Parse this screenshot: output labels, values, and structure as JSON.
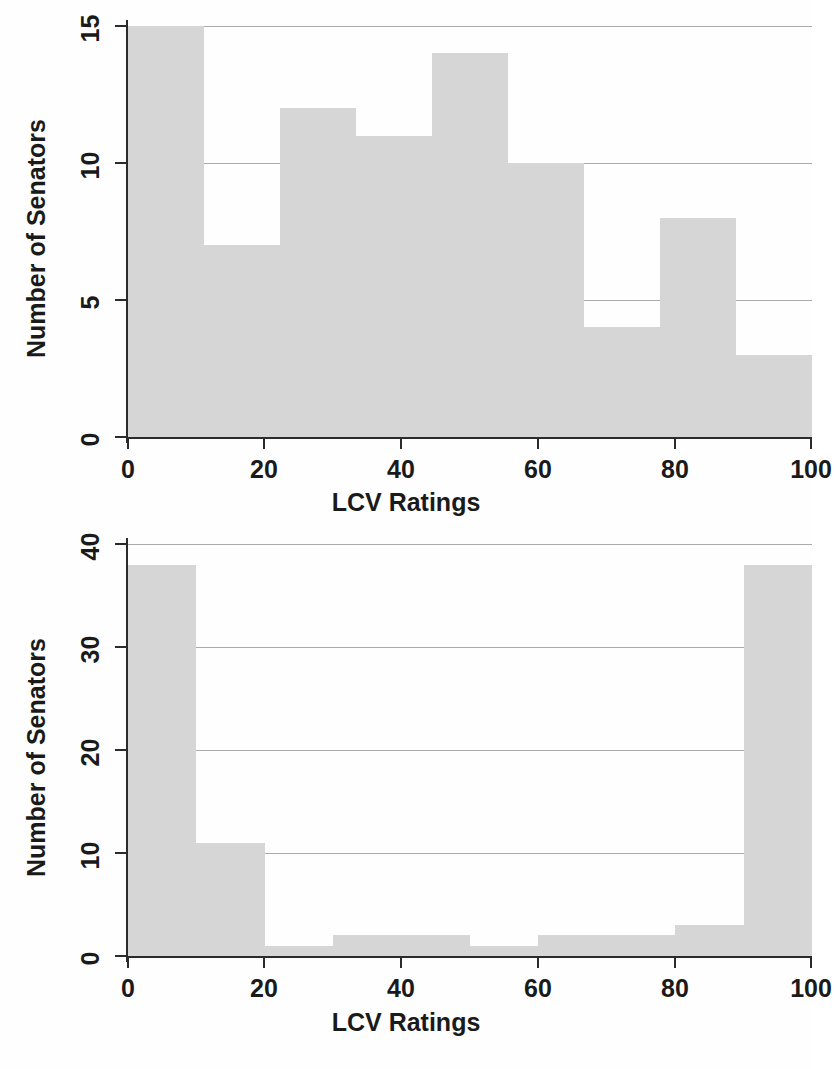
{
  "figure": {
    "background_color": "#fefefe",
    "bar_color": "#d6d6d6",
    "axis_color": "#2b2b2b",
    "grid_color": "#8e8e8e"
  },
  "charts": [
    {
      "id": "top",
      "xlabel": "LCV Ratings",
      "ylabel": "Number of Senators",
      "xticks": [
        "0",
        "20",
        "40",
        "60",
        "80",
        "100"
      ],
      "yticks": [
        "0",
        "5",
        "10",
        "15"
      ]
    },
    {
      "id": "bottom",
      "xlabel": "LCV Ratings",
      "ylabel": "Number of Senators",
      "xticks": [
        "0",
        "20",
        "40",
        "60",
        "80",
        "100"
      ],
      "yticks": [
        "0",
        "10",
        "20",
        "30",
        "40"
      ]
    }
  ],
  "chart_data": [
    {
      "type": "bar",
      "id": "top-histogram",
      "title": "",
      "xlabel": "LCV Ratings",
      "ylabel": "Number of Senators",
      "xlim": [
        0,
        100
      ],
      "ylim": [
        0,
        15
      ],
      "xticks": [
        0,
        20,
        40,
        60,
        80,
        100
      ],
      "yticks": [
        0,
        5,
        10,
        15
      ],
      "grid": true,
      "grid_axis": "y",
      "bin_edges": [
        0,
        11.1,
        22.2,
        33.3,
        44.4,
        55.6,
        66.7,
        77.8,
        88.9,
        100
      ],
      "categories": [
        "0-11",
        "11-22",
        "22-33",
        "33-44",
        "44-56",
        "56-67",
        "67-78",
        "78-89",
        "89-100"
      ],
      "values": [
        15,
        7,
        12,
        11,
        14,
        10,
        4,
        8,
        3
      ],
      "legend": null
    },
    {
      "type": "bar",
      "id": "bottom-histogram",
      "title": "",
      "xlabel": "LCV Ratings",
      "ylabel": "Number of Senators",
      "xlim": [
        0,
        100
      ],
      "ylim": [
        0,
        40
      ],
      "xticks": [
        0,
        20,
        40,
        60,
        80,
        100
      ],
      "yticks": [
        0,
        10,
        20,
        30,
        40
      ],
      "grid": true,
      "grid_axis": "y",
      "bin_edges": [
        0,
        10,
        20,
        30,
        40,
        50,
        60,
        70,
        80,
        90,
        100
      ],
      "categories": [
        "0-10",
        "10-20",
        "20-30",
        "30-40",
        "40-50",
        "50-60",
        "60-70",
        "70-80",
        "80-90",
        "90-100"
      ],
      "values": [
        38,
        11,
        1,
        2,
        2,
        1,
        2,
        2,
        3,
        38
      ],
      "legend": null
    }
  ]
}
